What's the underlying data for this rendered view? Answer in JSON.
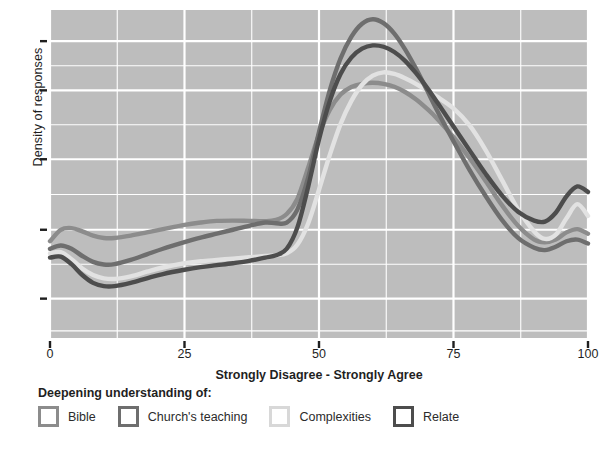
{
  "chart_data": {
    "type": "line",
    "title": "",
    "subtitle": "",
    "xlabel": "Strongly Disagree - Strongly Agree",
    "ylabel": "Density of responses",
    "xlim": [
      0,
      100
    ],
    "ylim": [
      0,
      1
    ],
    "grid": true,
    "grid_color": "#ffffff",
    "panel_color": "#bdbdbd",
    "legend_position": "bottom",
    "legend_title": "Deepening understanding of:",
    "xticks": [
      0,
      25,
      50,
      75,
      100
    ],
    "xtick_labels": [
      "0",
      "25",
      "50",
      "75",
      "100"
    ],
    "ytick_labels": [
      "",
      "",
      "",
      "",
      ""
    ],
    "ytick_values": [
      0.12,
      0.33,
      0.545,
      0.755,
      0.905
    ],
    "x": [
      0,
      2,
      4,
      6,
      8,
      10,
      12,
      15,
      18,
      21,
      25,
      28,
      31,
      34,
      37,
      40,
      42,
      44,
      46,
      48,
      50,
      52,
      54,
      56,
      58,
      60,
      62,
      64,
      66,
      68,
      70,
      72,
      75,
      78,
      81,
      84,
      87,
      90,
      92,
      94,
      96,
      98,
      100
    ],
    "series": [
      {
        "name": "Bible",
        "color": "#8c8c8c",
        "values": [
          0.295,
          0.33,
          0.335,
          0.325,
          0.312,
          0.305,
          0.305,
          0.312,
          0.322,
          0.332,
          0.345,
          0.352,
          0.357,
          0.358,
          0.357,
          0.356,
          0.36,
          0.378,
          0.425,
          0.52,
          0.62,
          0.695,
          0.742,
          0.765,
          0.775,
          0.778,
          0.775,
          0.766,
          0.75,
          0.728,
          0.7,
          0.668,
          0.612,
          0.548,
          0.478,
          0.405,
          0.342,
          0.3,
          0.292,
          0.3,
          0.322,
          0.332,
          0.318
        ]
      },
      {
        "name": "Church's teaching",
        "color": "#6e6e6e",
        "values": [
          0.272,
          0.282,
          0.272,
          0.25,
          0.232,
          0.224,
          0.225,
          0.238,
          0.255,
          0.272,
          0.292,
          0.306,
          0.318,
          0.33,
          0.342,
          0.352,
          0.35,
          0.352,
          0.392,
          0.49,
          0.628,
          0.755,
          0.852,
          0.918,
          0.958,
          0.972,
          0.96,
          0.928,
          0.88,
          0.822,
          0.758,
          0.692,
          0.6,
          0.512,
          0.432,
          0.36,
          0.305,
          0.275,
          0.268,
          0.278,
          0.295,
          0.3,
          0.288
        ]
      },
      {
        "name": "Complexities",
        "color": "#e2e2e2",
        "values": [
          0.258,
          0.262,
          0.24,
          0.212,
          0.192,
          0.182,
          0.18,
          0.188,
          0.202,
          0.215,
          0.228,
          0.234,
          0.238,
          0.242,
          0.246,
          0.25,
          0.252,
          0.258,
          0.285,
          0.35,
          0.452,
          0.558,
          0.652,
          0.722,
          0.772,
          0.8,
          0.81,
          0.805,
          0.792,
          0.775,
          0.755,
          0.735,
          0.7,
          0.648,
          0.572,
          0.482,
          0.392,
          0.325,
          0.302,
          0.315,
          0.365,
          0.408,
          0.372
        ]
      },
      {
        "name": "Relate",
        "color": "#4d4d4d",
        "values": [
          0.245,
          0.248,
          0.225,
          0.192,
          0.168,
          0.158,
          0.158,
          0.168,
          0.182,
          0.195,
          0.208,
          0.216,
          0.222,
          0.228,
          0.235,
          0.245,
          0.252,
          0.272,
          0.338,
          0.462,
          0.605,
          0.722,
          0.805,
          0.855,
          0.882,
          0.892,
          0.888,
          0.872,
          0.845,
          0.808,
          0.765,
          0.718,
          0.645,
          0.572,
          0.5,
          0.435,
          0.385,
          0.358,
          0.355,
          0.382,
          0.432,
          0.462,
          0.445
        ]
      }
    ]
  },
  "axes": {
    "x_title": "Strongly Disagree - Strongly Agree",
    "y_title": "Density of responses",
    "x_tick_labels": [
      "0",
      "25",
      "50",
      "75",
      "100"
    ]
  },
  "legend": {
    "title": "Deepening understanding of:",
    "items": [
      {
        "label": "Bible",
        "color": "#8c8c8c"
      },
      {
        "label": "Church's teaching",
        "color": "#6e6e6e"
      },
      {
        "label": "Complexities",
        "color": "#d8d8d8"
      },
      {
        "label": "Relate",
        "color": "#4d4d4d"
      }
    ]
  }
}
